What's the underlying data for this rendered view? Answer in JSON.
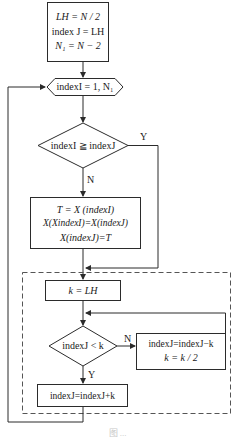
{
  "diagram": {
    "type": "flowchart",
    "nodes": {
      "init": {
        "shape": "process",
        "lines": [
          "LH = N / 2",
          "index J = LH",
          "N₁ = N − 2"
        ]
      },
      "loop": {
        "shape": "hexagon",
        "text": "indexI = 1, N₁"
      },
      "compare": {
        "shape": "decision",
        "text": "indexI ≧ indexJ"
      },
      "swap": {
        "shape": "process",
        "lines": [
          "T = X (indexI)",
          "X(XindexI)=X(indexJ)",
          "X(indexJ)=T"
        ]
      },
      "set_k": {
        "shape": "process",
        "text": "k = LH"
      },
      "check_k": {
        "shape": "decision",
        "text": "indexJ < k"
      },
      "update": {
        "shape": "process",
        "lines": [
          "indexJ=indexJ−k",
          "k = k / 2"
        ]
      },
      "final": {
        "shape": "process",
        "text": "indexJ=indexJ+k"
      }
    },
    "edge_labels": {
      "compare_yes": "Y",
      "compare_no": "N",
      "check_no": "N",
      "check_yes": "Y"
    },
    "group": {
      "style": "dashed",
      "contains": [
        "set_k",
        "check_k",
        "update",
        "final"
      ]
    },
    "colors": {
      "stroke": "#2b2b2b",
      "dashed": "#555555",
      "background": "#ffffff"
    },
    "caption": "图 ..."
  }
}
